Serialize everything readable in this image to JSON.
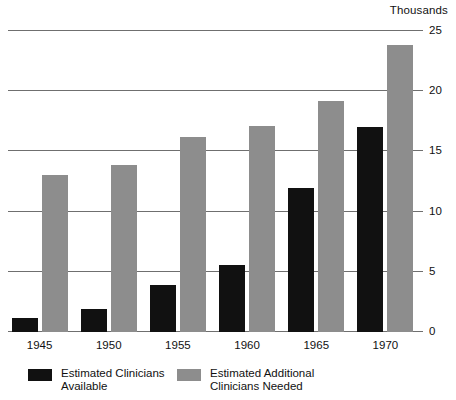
{
  "chart_data": {
    "type": "bar",
    "title": "",
    "subtitle": "",
    "units_caption": "Thousands",
    "xlabel": "",
    "ylabel": "",
    "ylim": [
      0,
      25
    ],
    "yticks": [
      0,
      5,
      10,
      15,
      20,
      25
    ],
    "ytick_labels": [
      "0",
      "5",
      "10",
      "15",
      "20",
      "25"
    ],
    "grid": "horizontal",
    "legend_position": "bottom-left",
    "categories": [
      "1945",
      "1950",
      "1955",
      "1960",
      "1965",
      "1970"
    ],
    "series": [
      {
        "name": "Estimated Clinicians\nAvailable",
        "color": "#111111",
        "values": [
          1.2,
          1.9,
          3.9,
          5.6,
          12.0,
          17.0
        ]
      },
      {
        "name": "Estimated Additional\nClinicians Needed",
        "color": "#8d8d8d",
        "values": [
          13.0,
          13.9,
          16.2,
          17.1,
          19.2,
          23.8
        ]
      }
    ]
  },
  "legend": {
    "entries": [
      {
        "label": "Estimated Clinicians\nAvailable",
        "color": "#111111"
      },
      {
        "label": "Estimated Additional\nClinicians Needed",
        "color": "#8d8d8d"
      }
    ]
  }
}
